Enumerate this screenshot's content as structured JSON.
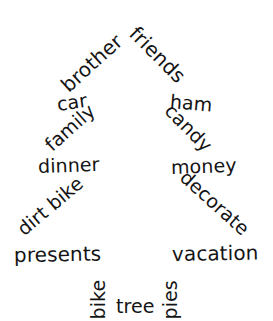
{
  "canvas": {
    "width": 273,
    "height": 321,
    "background": "#ffffff",
    "text_color": "#141414",
    "shape": "christmas-tree"
  },
  "wordcloud": {
    "title": "Christmas tree word cloud",
    "shape": "christmas-tree",
    "words": [
      {
        "text": "brother",
        "x": 64,
        "y": 78,
        "rotation": -42,
        "size": 20
      },
      {
        "text": "friends",
        "x": 133,
        "y": 20,
        "rotation": 45,
        "size": 20
      },
      {
        "text": "car",
        "x": 57,
        "y": 95,
        "rotation": -8,
        "size": 19
      },
      {
        "text": "ham",
        "x": 170,
        "y": 92,
        "rotation": 5,
        "size": 19
      },
      {
        "text": "family",
        "x": 48,
        "y": 138,
        "rotation": -42,
        "size": 19
      },
      {
        "text": "candy",
        "x": 168,
        "y": 98,
        "rotation": 45,
        "size": 19
      },
      {
        "text": "dinner",
        "x": 38,
        "y": 157,
        "rotation": -2,
        "size": 19
      },
      {
        "text": "money",
        "x": 171,
        "y": 158,
        "rotation": -2,
        "size": 19
      },
      {
        "text": "dirt bike",
        "x": 20,
        "y": 222,
        "rotation": -40,
        "size": 19
      },
      {
        "text": "decorate",
        "x": 183,
        "y": 165,
        "rotation": 42,
        "size": 19
      },
      {
        "text": "presents",
        "x": 14,
        "y": 245,
        "rotation": -1,
        "size": 20
      },
      {
        "text": "vacation",
        "x": 172,
        "y": 244,
        "rotation": -1,
        "size": 20
      },
      {
        "text": "bike",
        "x": 98,
        "y": 310,
        "rotation": -90,
        "size": 19
      },
      {
        "text": "tree",
        "x": 116,
        "y": 297,
        "rotation": 0,
        "size": 19
      },
      {
        "text": "pies",
        "x": 170,
        "y": 310,
        "rotation": -90,
        "size": 19
      }
    ]
  },
  "chart_data": {
    "type": "wordcloud",
    "shape": "christmas-tree",
    "categories": [
      "brother",
      "friends",
      "car",
      "ham",
      "family",
      "candy",
      "dinner",
      "money",
      "dirt bike",
      "decorate",
      "presents",
      "vacation",
      "bike",
      "tree",
      "pies"
    ],
    "values": [
      20,
      20,
      19,
      19,
      19,
      19,
      19,
      19,
      19,
      19,
      20,
      20,
      19,
      19,
      19
    ],
    "xlabel": "",
    "ylabel": "",
    "legend": "none",
    "grid": false
  }
}
